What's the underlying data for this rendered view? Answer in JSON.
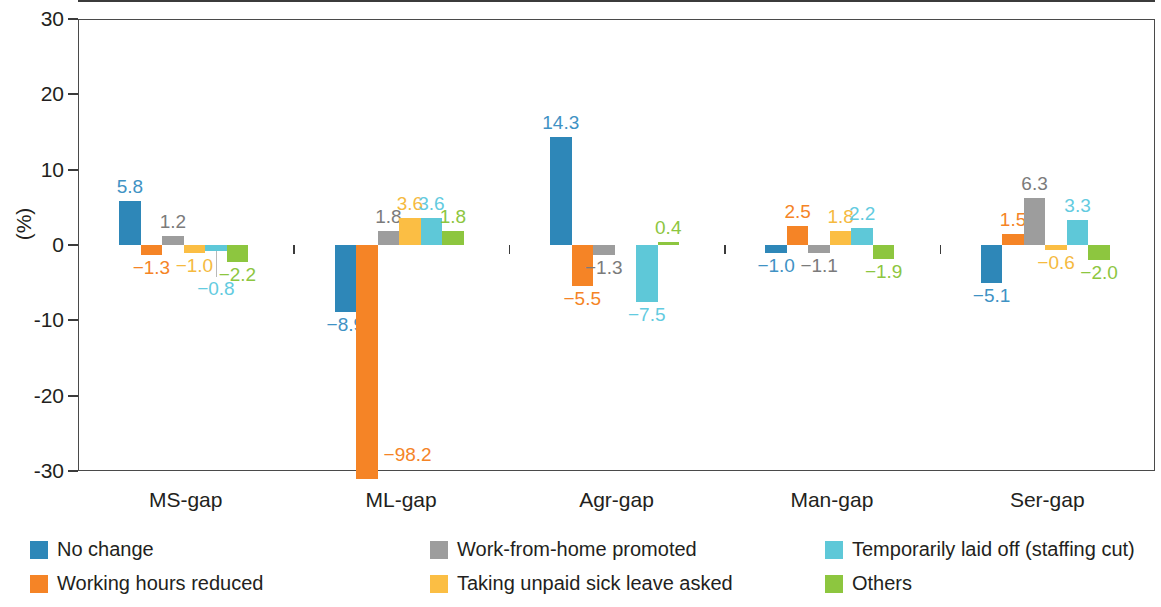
{
  "chart_data": {
    "type": "bar",
    "title": "",
    "subtitle": "",
    "xlabel": "",
    "ylabel": "(%)",
    "ylim": [
      -30,
      30
    ],
    "ytick_values": [
      30,
      20,
      10,
      0,
      -10,
      -20,
      -30
    ],
    "ytick_labels": [
      "30",
      "20",
      "10",
      "0",
      "-10",
      "-20",
      "-30"
    ],
    "grid": false,
    "legend_position": "bottom",
    "categories": [
      "MS-gap",
      "ML-gap",
      "Agr-gap",
      "Man-gap",
      "Ser-gap"
    ],
    "series": [
      {
        "name": "No change",
        "color": "#2e87b8",
        "label_color": "#3f92c4",
        "values": [
          5.8,
          -8.9,
          14.3,
          -1.0,
          -5.1
        ],
        "labels": [
          "5.8",
          "−8.9",
          "14.3",
          "−1.0",
          "−5.1"
        ]
      },
      {
        "name": "Working hours reduced",
        "color": "#f58426",
        "label_color": "#f58426",
        "values": [
          -1.3,
          -98.2,
          -5.5,
          2.5,
          1.5
        ],
        "labels": [
          "−1.3",
          "−98.2",
          "−5.5",
          "2.5",
          "1.5"
        ],
        "clipped": [
          false,
          true,
          false,
          false,
          false
        ]
      },
      {
        "name": "Work-from-home promoted",
        "color": "#9d9d9d",
        "label_color": "#7b7b7b",
        "values": [
          1.2,
          1.8,
          -1.3,
          -1.1,
          6.3
        ],
        "labels": [
          "1.2",
          "1.8",
          "−1.3",
          "−1.1",
          "6.3"
        ]
      },
      {
        "name": "Taking unpaid sick leave asked",
        "color": "#fbbe44",
        "label_color": "#f5ba3f",
        "values": [
          -1.0,
          3.6,
          0.0,
          1.8,
          -0.6
        ],
        "labels": [
          "−1.0",
          "3.6",
          "",
          "1.8",
          "−0.6"
        ]
      },
      {
        "name": "Temporarily laid off (staffing cut)",
        "color": "#5ec8d8",
        "label_color": "#63cbe0",
        "values": [
          -0.8,
          3.6,
          -7.5,
          2.2,
          3.3
        ],
        "labels": [
          "−0.8",
          "3.6",
          "−7.5",
          "2.2",
          "3.3"
        ],
        "leader": [
          true,
          false,
          false,
          false,
          false
        ]
      },
      {
        "name": "Others",
        "color": "#8dc63f",
        "label_color": "#8dc63f",
        "values": [
          -2.2,
          1.8,
          0.4,
          -1.9,
          -2.0
        ],
        "labels": [
          "−2.2",
          "1.8",
          "0.4",
          "−1.9",
          "−2.0"
        ]
      }
    ]
  },
  "legend": {
    "items": [
      {
        "label": "No change",
        "color": "#2e87b8"
      },
      {
        "label": "Working hours reduced",
        "color": "#f58426"
      },
      {
        "label": "Work-from-home promoted",
        "color": "#9d9d9d"
      },
      {
        "label": "Taking unpaid sick leave asked",
        "color": "#fbbe44"
      },
      {
        "label": "Temporarily laid off (staffing cut)",
        "color": "#5ec8d8"
      },
      {
        "label": "Others",
        "color": "#8dc63f"
      }
    ]
  }
}
